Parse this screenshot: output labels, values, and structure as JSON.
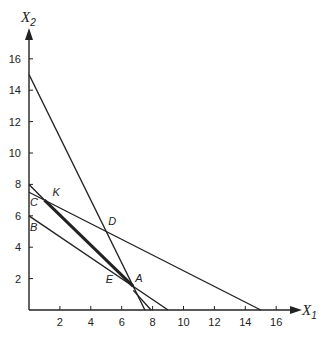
{
  "chart_data": {
    "type": "line",
    "title": "",
    "xlabel": "X1",
    "ylabel": "X2",
    "xlim": [
      0,
      17
    ],
    "ylim": [
      0,
      17
    ],
    "grid": false,
    "x_ticks": [
      2,
      4,
      6,
      8,
      10,
      12,
      14,
      16
    ],
    "y_ticks": [
      2,
      4,
      6,
      8,
      10,
      12,
      14,
      16
    ],
    "series": [
      {
        "name": "line-2x1+x2=15",
        "points": [
          [
            0,
            15
          ],
          [
            7.5,
            0
          ]
        ],
        "weight": "normal"
      },
      {
        "name": "line-x1+2x2=15",
        "points": [
          [
            0,
            7.5
          ],
          [
            15,
            0
          ]
        ],
        "weight": "normal"
      },
      {
        "name": "line-2x1+3x2=18",
        "points": [
          [
            0,
            6
          ],
          [
            9,
            0
          ]
        ],
        "weight": "normal"
      },
      {
        "name": "line-x1+x2=8",
        "points": [
          [
            0,
            8
          ],
          [
            8,
            0
          ]
        ],
        "weight": "normal"
      },
      {
        "name": "thick-segment-K-A",
        "points": [
          [
            1,
            7
          ],
          [
            6.75,
            1.5
          ]
        ],
        "weight": "bold"
      }
    ],
    "annotations": [
      {
        "label": "K",
        "x": 1,
        "y": 7
      },
      {
        "label": "C",
        "x": 0,
        "y": 7.5
      },
      {
        "label": "B",
        "x": 0,
        "y": 6
      },
      {
        "label": "D",
        "x": 5,
        "y": 5
      },
      {
        "label": "E",
        "x": 6,
        "y": 2
      },
      {
        "label": "A",
        "x": 6.75,
        "y": 1.5
      }
    ]
  },
  "axes": {
    "x_label": "X",
    "x_sub": "1",
    "y_label": "X",
    "y_sub": "2"
  }
}
